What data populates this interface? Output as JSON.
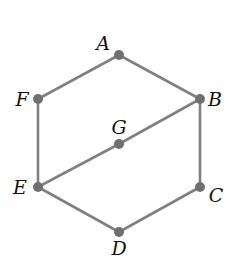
{
  "diagram": {
    "type": "graph",
    "colors": {
      "edge": "#808080",
      "node": "#707070",
      "label": "#111111",
      "background": "#ffffff"
    },
    "nodes": [
      {
        "id": "A",
        "label": "A",
        "x": 119,
        "y": 55,
        "lx": 103,
        "ly": 50
      },
      {
        "id": "B",
        "label": "B",
        "x": 200,
        "y": 99,
        "lx": 215,
        "ly": 106
      },
      {
        "id": "C",
        "label": "C",
        "x": 200,
        "y": 187,
        "lx": 216,
        "ly": 202
      },
      {
        "id": "D",
        "label": "D",
        "x": 119,
        "y": 232,
        "lx": 119,
        "ly": 255
      },
      {
        "id": "E",
        "label": "E",
        "x": 38,
        "y": 187,
        "lx": 20,
        "ly": 194
      },
      {
        "id": "F",
        "label": "F",
        "x": 38,
        "y": 99,
        "lx": 22,
        "ly": 106
      },
      {
        "id": "G",
        "label": "G",
        "x": 119,
        "y": 144,
        "lx": 119,
        "ly": 134
      }
    ],
    "edges": [
      [
        "A",
        "B"
      ],
      [
        "B",
        "C"
      ],
      [
        "C",
        "D"
      ],
      [
        "D",
        "E"
      ],
      [
        "E",
        "F"
      ],
      [
        "F",
        "A"
      ],
      [
        "E",
        "G"
      ],
      [
        "G",
        "B"
      ]
    ]
  }
}
